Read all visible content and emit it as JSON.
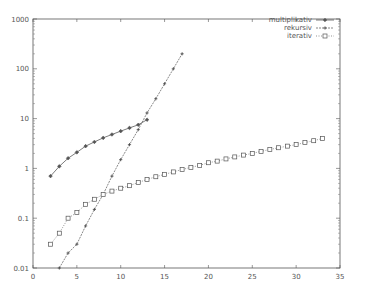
{
  "chart_data": {
    "type": "line",
    "title": "",
    "xlabel": "",
    "ylabel": "",
    "x_scale": "linear",
    "y_scale": "log",
    "xlim": [
      0,
      35
    ],
    "ylim": [
      0.01,
      1000
    ],
    "x_ticks": [
      0,
      5,
      10,
      15,
      20,
      25,
      30,
      35
    ],
    "x_tick_labels": [
      "0",
      "5",
      "10",
      "15",
      "20",
      "25",
      "30",
      "35"
    ],
    "y_ticks": [
      0.01,
      0.1,
      1,
      10,
      100,
      1000
    ],
    "y_tick_labels": [
      "0.01",
      "0.1",
      "1",
      "10",
      "100",
      "1000"
    ],
    "grid": false,
    "legend_position": "top-right",
    "series": [
      {
        "name": "multiplikativ",
        "marker": "diamond",
        "line": "solid",
        "x": [
          2,
          3,
          4,
          5,
          6,
          7,
          8,
          9,
          10,
          11,
          12,
          13
        ],
        "values": [
          0.7,
          1.1,
          1.6,
          2.1,
          2.8,
          3.4,
          4.1,
          4.8,
          5.6,
          6.5,
          7.5,
          9.5
        ]
      },
      {
        "name": "rekursiv",
        "marker": "plus",
        "line": "dashed",
        "x": [
          3,
          4,
          5,
          6,
          7,
          8,
          9,
          10,
          11,
          12,
          13,
          14,
          15,
          16,
          17
        ],
        "values": [
          0.01,
          0.02,
          0.03,
          0.07,
          0.15,
          0.3,
          0.7,
          1.5,
          3,
          6,
          13,
          25,
          50,
          100,
          200
        ]
      },
      {
        "name": "iterativ",
        "marker": "square",
        "line": "dotted",
        "x": [
          2,
          3,
          4,
          5,
          6,
          7,
          8,
          9,
          10,
          11,
          12,
          13,
          14,
          15,
          16,
          17,
          18,
          19,
          20,
          21,
          22,
          23,
          24,
          25,
          26,
          27,
          28,
          29,
          30,
          31,
          32,
          33
        ],
        "values": [
          0.03,
          0.05,
          0.1,
          0.13,
          0.19,
          0.24,
          0.3,
          0.35,
          0.4,
          0.45,
          0.52,
          0.6,
          0.68,
          0.76,
          0.85,
          0.95,
          1.05,
          1.15,
          1.3,
          1.4,
          1.55,
          1.7,
          1.85,
          2.0,
          2.2,
          2.4,
          2.6,
          2.8,
          3.0,
          3.3,
          3.6,
          4.0
        ]
      }
    ]
  },
  "legend": {
    "items": [
      {
        "label": "multiplikativ"
      },
      {
        "label": "rekursiv"
      },
      {
        "label": "iterativ"
      }
    ]
  }
}
